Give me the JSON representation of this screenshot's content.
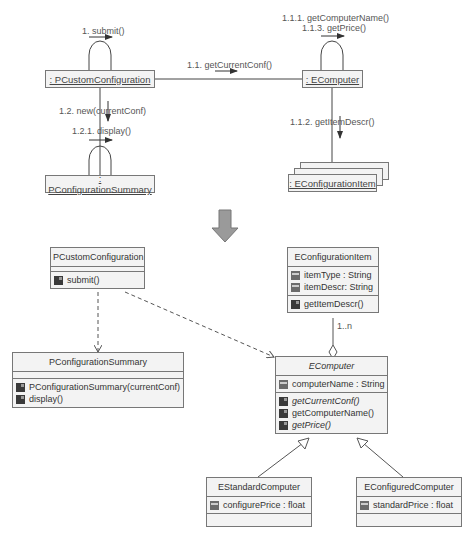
{
  "collaboration": {
    "objects": {
      "custom_config": ": PCustomConfiguration",
      "summary": ": PConfigurationSummary",
      "computer": ": EComputer",
      "item": ": EConfigurationItem"
    },
    "messages": {
      "m1": "1. submit()",
      "m11": "1.1. getCurrentConf()",
      "m111": "1.1.1. getComputerName()",
      "m113": "1.1.3. getPrice()",
      "m112": "1.1.2. getItemDescr()",
      "m12": "1.2. new(currentConf)",
      "m121": "1.2.1. display()"
    }
  },
  "transform_arrow": "down-arrow-icon",
  "class_diagram": {
    "classes": {
      "pcustom": {
        "name": "PCustomConfiguration",
        "attributes": [],
        "operations": [
          "submit()"
        ]
      },
      "psummary": {
        "name": "PConfigurationSummary",
        "attributes": [],
        "operations": [
          "PConfigurationSummary(currentConf)",
          "display()"
        ]
      },
      "eitem": {
        "name": "EConfigurationItem",
        "attributes": [
          "itemType : String",
          "itemDescr: String"
        ],
        "operations": [
          "getItemDescr()"
        ]
      },
      "ecomputer": {
        "name": "EComputer",
        "abstract": true,
        "attributes": [
          "computerName : String"
        ],
        "operations": [
          "getCurrentConf()",
          "getComputerName()",
          "getPrice()"
        ]
      },
      "estandard": {
        "name": "EStandardComputer",
        "attributes": [
          "configurePrice : float"
        ],
        "operations": []
      },
      "econfigured": {
        "name": "EConfiguredComputer",
        "attributes": [
          "standardPrice : float"
        ],
        "operations": []
      }
    },
    "multiplicity": "1..n"
  }
}
